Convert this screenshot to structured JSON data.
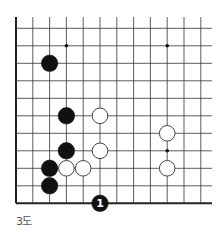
{
  "diagram": {
    "caption": "3도",
    "board": {
      "columns": 12,
      "rows": 11,
      "origin_x": 16,
      "origin_y": 203.3,
      "col_spacing": 16.8,
      "row_spacing": 17.5,
      "top_y": 17,
      "right_x": 212,
      "edges": [
        "left",
        "bottom"
      ],
      "line_color": "#333333",
      "edge_color": "#222222"
    },
    "star_points": [
      {
        "col": 3,
        "row": 9
      },
      {
        "col": 9,
        "row": 9
      },
      {
        "col": 9,
        "row": 3
      }
    ],
    "stones": [
      {
        "color": "black",
        "col": 2,
        "row": 8
      },
      {
        "color": "black",
        "col": 3,
        "row": 5
      },
      {
        "color": "white",
        "col": 5,
        "row": 5
      },
      {
        "color": "white",
        "col": 9,
        "row": 4
      },
      {
        "color": "black",
        "col": 3,
        "row": 3
      },
      {
        "color": "white",
        "col": 5,
        "row": 3
      },
      {
        "color": "black",
        "col": 2,
        "row": 2
      },
      {
        "color": "white",
        "col": 3,
        "row": 2
      },
      {
        "color": "white",
        "col": 4,
        "row": 2
      },
      {
        "color": "white",
        "col": 9,
        "row": 2
      },
      {
        "color": "black",
        "col": 2,
        "row": 1
      },
      {
        "color": "black",
        "col": 5,
        "row": 0,
        "label": "1"
      }
    ],
    "colors": {
      "black_stone": "#111111",
      "white_stone": "#ffffff",
      "white_stone_outline": "#444444",
      "label_on_black": "#ffffff"
    }
  }
}
